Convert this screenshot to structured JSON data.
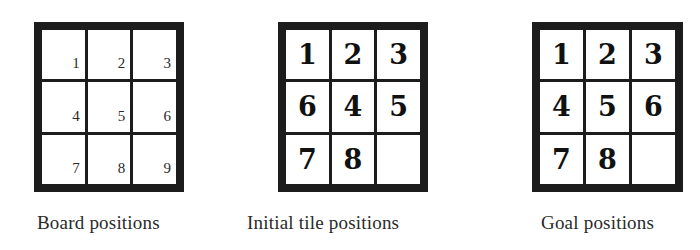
{
  "figure": {
    "boards": [
      {
        "id": "board-positions",
        "caption": "Board positions",
        "style": "position-index",
        "cells": [
          "1",
          "2",
          "3",
          "4",
          "5",
          "6",
          "7",
          "8",
          "9"
        ]
      },
      {
        "id": "initial-tile-positions",
        "caption": "Initial tile positions",
        "style": "tile",
        "cells": [
          "1",
          "2",
          "3",
          "6",
          "4",
          "5",
          "7",
          "8",
          ""
        ]
      },
      {
        "id": "goal-positions",
        "caption": "Goal positions",
        "style": "tile",
        "cells": [
          "1",
          "2",
          "3",
          "4",
          "5",
          "6",
          "7",
          "8",
          ""
        ]
      }
    ],
    "colors": {
      "grid": "#1c1c1c",
      "cell_background": "#ffffff",
      "text": "#1a1a1a"
    }
  }
}
